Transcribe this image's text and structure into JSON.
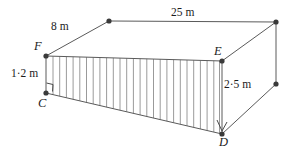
{
  "figure": {
    "type": "3d-prism-geometry-diagram",
    "stroke_color": "#4a4a4a",
    "vertex_color": "#333333",
    "hatch_color": "#8c8c8c",
    "background": "#ffffff",
    "vertex_labels": [
      {
        "id": "F",
        "text": "F",
        "x": 46,
        "y": 56
      },
      {
        "id": "C",
        "text": "C",
        "x": 46,
        "y": 93
      },
      {
        "id": "E",
        "text": "E",
        "x": 222,
        "y": 61
      },
      {
        "id": "D",
        "text": "D",
        "x": 222,
        "y": 134
      }
    ],
    "dimension_labels": [
      {
        "id": "FB",
        "text": "8 m",
        "edge": "F-to-back-top-left"
      },
      {
        "id": "top",
        "text": "25 m",
        "edge": "back-top-left-to-back-top-right"
      },
      {
        "id": "CF",
        "text": "1·2 m",
        "edge": "C-to-F"
      },
      {
        "id": "DE",
        "text": "2·5 m",
        "edge": "D-to-E"
      }
    ],
    "points": {
      "F": {
        "x": 46,
        "y": 56
      },
      "C": {
        "x": 46,
        "y": 93
      },
      "E": {
        "x": 222,
        "y": 61
      },
      "D": {
        "x": 222,
        "y": 134
      },
      "B1": {
        "x": 109,
        "y": 21
      },
      "B2": {
        "x": 276,
        "y": 22
      },
      "B3": {
        "x": 276,
        "y": 84
      }
    },
    "hatching": {
      "from_x": 53,
      "to_x": 219,
      "spacing": 6.7,
      "top_edge": "F-E",
      "bottom_edge": "C-D"
    },
    "right_angle_markers": [
      {
        "at": "C",
        "x": 47,
        "y": 82
      },
      {
        "at": "D",
        "x": 219,
        "y": 120
      }
    ]
  }
}
